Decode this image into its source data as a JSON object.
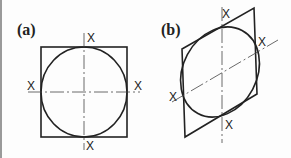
{
  "figure": {
    "panels": [
      {
        "label": "(a)",
        "description": "Circle inscribed in square with horizontal and vertical center lines",
        "axis_marks": [
          "X",
          "X",
          "X",
          "X"
        ]
      },
      {
        "label": "(b)",
        "description": "Ellipse inscribed in rhombus (parallelogram) with inclined and vertical center lines",
        "axis_marks": [
          "X",
          "X",
          "X",
          "X"
        ]
      }
    ],
    "colors": {
      "line": "#222222",
      "background": "#fdfdfd",
      "border": "#9a9a9a"
    }
  }
}
